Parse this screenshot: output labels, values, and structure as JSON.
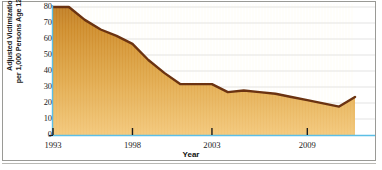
{
  "chart_data": {
    "type": "area",
    "title": "",
    "xlabel": "Year",
    "ylabel": "Adjusted Victimization Rate per 1,000 Persons Age 12 and Over",
    "ylabel_line1": "Adjusted Victimization Rate",
    "ylabel_line2": "per 1,000 Persons Age 12 and Over",
    "xlim": [
      1993,
      2012
    ],
    "ylim": [
      0,
      80
    ],
    "yticks": [
      0,
      10,
      20,
      30,
      40,
      50,
      60,
      70,
      80
    ],
    "ytick_labels": [
      "0",
      "10",
      "20",
      "30",
      "40",
      "50",
      "60",
      "70",
      "80"
    ],
    "xticks": [
      1993,
      1998,
      2003,
      2009
    ],
    "xtick_labels": [
      "1993",
      "1998",
      "2003",
      "2009"
    ],
    "grid": "horizontal",
    "legend": "none",
    "x": [
      1993,
      1994,
      1995,
      1996,
      1997,
      1998,
      1999,
      2000,
      2001,
      2002,
      2003,
      2004,
      2005,
      2006,
      2007,
      2008,
      2009,
      2010,
      2011,
      2012
    ],
    "values": [
      80,
      80,
      72,
      66,
      62,
      57,
      47,
      39,
      32,
      32,
      32,
      27,
      28,
      27,
      26,
      24,
      22,
      20,
      18,
      24
    ],
    "series": [
      {
        "name": "Adjusted Victimization Rate",
        "values": [
          80,
          80,
          72,
          66,
          62,
          57,
          47,
          39,
          32,
          32,
          32,
          27,
          28,
          27,
          26,
          24,
          22,
          20,
          18,
          24
        ]
      }
    ],
    "colors": {
      "line": "#6b3311",
      "fill_top": "#c8832a",
      "fill_bottom": "#f0c070",
      "axis": "#6fc3e8",
      "grid": "#d8d8d8",
      "frame": "#9a9a96",
      "text": "#1b1b1b"
    }
  }
}
